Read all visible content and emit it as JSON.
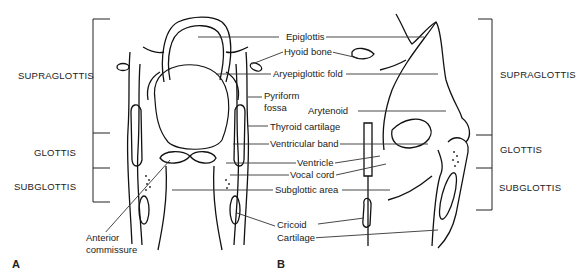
{
  "panels": {
    "a": "A",
    "b": "B"
  },
  "regions_left": {
    "supraglottis": "SUPRAGLOTTIS",
    "glottis": "GLOTTIS",
    "subglottis": "SUBGLOTTIS"
  },
  "regions_right": {
    "supraglottis": "SUPRAGLOTTIS",
    "glottis": "GLOTTIS",
    "subglottis": "SUBGLOTTIS"
  },
  "labels": {
    "epiglottis": "Epiglottis",
    "hyoid_bone": "Hyoid bone",
    "aryepiglottic_fold": "Aryepiglottic fold",
    "pyriform_fossa_1": "Pyriform",
    "pyriform_fossa_2": "fossa",
    "arytenoid": "Arytenoid",
    "thyroid_cartilage": "Thyroid cartilage",
    "ventricular_band": "Ventricular band",
    "ventricle": "Ventricle",
    "vocal_cord": "Vocal cord",
    "subglottic_area": "Subglottic area",
    "cricoid_1": "Cricoid",
    "cricoid_2": "Cartilage",
    "anterior_commissure_1": "Anterior",
    "anterior_commissure_2": "commissure"
  }
}
